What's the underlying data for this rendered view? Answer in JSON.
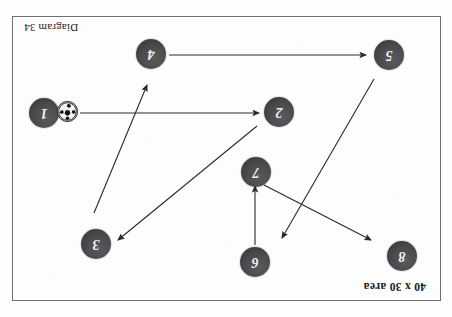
{
  "page": {
    "orientation": "upside-down",
    "rotation_degrees": 180,
    "background_color": "#fdfdfd",
    "border_color": "#6f6f70"
  },
  "labels": {
    "area": "40 x 30 area",
    "diagram": "Diagram  34"
  },
  "players": [
    {
      "number": "1",
      "x": 408,
      "y": 204
    },
    {
      "number": "2",
      "x": 173,
      "y": 205
    },
    {
      "number": "3",
      "x": 356,
      "y": 73
    },
    {
      "number": "4",
      "x": 301,
      "y": 263
    },
    {
      "number": "5",
      "x": 63,
      "y": 262
    },
    {
      "number": "6",
      "x": 197,
      "y": 55
    },
    {
      "number": "7",
      "x": 196,
      "y": 145
    },
    {
      "number": "8",
      "x": 50,
      "y": 61
    }
  ],
  "ball": {
    "name": "soccer-ball",
    "x": 383,
    "y": 204
  },
  "arrows": [
    {
      "name": "arrow-6-to-7",
      "x1": 197,
      "y1": 72,
      "x2": 197,
      "y2": 131
    },
    {
      "name": "arrow-7-to-8",
      "x1": 188,
      "y1": 132,
      "x2": 81,
      "y2": 77
    },
    {
      "name": "arrow-5-to-upright",
      "x1": 78,
      "y1": 238,
      "x2": 170,
      "y2": 79
    },
    {
      "name": "arrow-2-to-3",
      "x1": 195,
      "y1": 191,
      "x2": 334,
      "y2": 77
    },
    {
      "name": "arrow-3-to-4",
      "x1": 358,
      "y1": 104,
      "x2": 305,
      "y2": 232
    },
    {
      "name": "arrow-ball-to-2",
      "x1": 372,
      "y1": 204,
      "x2": 193,
      "y2": 204
    },
    {
      "name": "arrow-4-to-5",
      "x1": 283,
      "y1": 262,
      "x2": 86,
      "y2": 262
    }
  ],
  "arrow_style": {
    "stroke_color": "#2a2a2a",
    "stroke_width": 1.1
  }
}
